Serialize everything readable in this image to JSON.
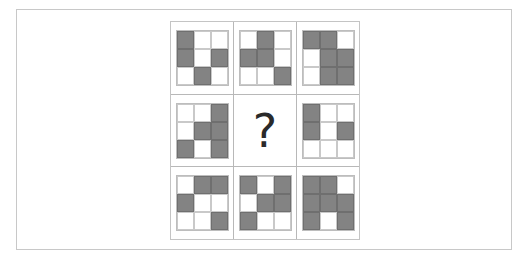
{
  "puzzle": {
    "colors": {
      "filled": "#838383",
      "empty": "#ffffff",
      "grid_line": "#c4c4c4",
      "question_mark": "#2a2a2a"
    },
    "missing_symbol": "?",
    "cells": [
      {
        "row": 1,
        "col": 1,
        "pattern": [
          [
            1,
            0,
            0
          ],
          [
            1,
            0,
            1
          ],
          [
            0,
            1,
            0
          ]
        ]
      },
      {
        "row": 1,
        "col": 2,
        "pattern": [
          [
            0,
            1,
            0
          ],
          [
            1,
            1,
            0
          ],
          [
            0,
            0,
            1
          ]
        ]
      },
      {
        "row": 1,
        "col": 3,
        "pattern": [
          [
            1,
            1,
            0
          ],
          [
            0,
            1,
            1
          ],
          [
            0,
            1,
            1
          ]
        ]
      },
      {
        "row": 2,
        "col": 1,
        "pattern": [
          [
            0,
            0,
            1
          ],
          [
            0,
            1,
            1
          ],
          [
            1,
            0,
            1
          ]
        ]
      },
      {
        "row": 2,
        "col": 2,
        "pattern": null
      },
      {
        "row": 2,
        "col": 3,
        "pattern": [
          [
            1,
            0,
            0
          ],
          [
            1,
            0,
            1
          ],
          [
            0,
            0,
            0
          ]
        ]
      },
      {
        "row": 3,
        "col": 1,
        "pattern": [
          [
            0,
            1,
            1
          ],
          [
            1,
            0,
            0
          ],
          [
            0,
            0,
            1
          ]
        ]
      },
      {
        "row": 3,
        "col": 2,
        "pattern": [
          [
            1,
            0,
            1
          ],
          [
            0,
            1,
            1
          ],
          [
            1,
            0,
            0
          ]
        ]
      },
      {
        "row": 3,
        "col": 3,
        "pattern": [
          [
            1,
            1,
            0
          ],
          [
            1,
            1,
            1
          ],
          [
            1,
            0,
            1
          ]
        ]
      }
    ]
  }
}
